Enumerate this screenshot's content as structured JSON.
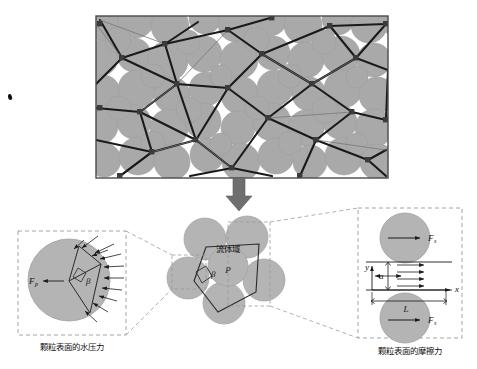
{
  "figure": {
    "domain_type": "scientific-schematic",
    "description_labels": {
      "top_panel": "granular microstructure with pore network",
      "center_panel": "fluid domain between particles",
      "left_panel": "water pressure on particle surface",
      "right_panel": "friction force on particle surface"
    }
  },
  "colors": {
    "particle_gray": "#a9a9a9",
    "particle_edge": "#8f8f8f",
    "pore_white": "#ffffff",
    "network_line": "#1a1a1a",
    "node_square": "#3b3b3b",
    "panel_border": "#4a4a4a",
    "dashed_box": "#9a9a9a",
    "arrow_gray": "#6f6f6f",
    "text": "#111111",
    "background": "#ffffff"
  },
  "top_panel": {
    "name": "granular-microstructure-image",
    "border_color": "#4a4a4a",
    "background_gray": "#a9a9a9"
  },
  "flow_arrow": {
    "name": "downward-transition-arrow",
    "direction": "down",
    "color": "#6f6f6f"
  },
  "center_panel": {
    "fluid_domain_label": "流体域",
    "pressure_symbol": "P",
    "angle_symbol": "β"
  },
  "left_panel": {
    "caption": "颗粒表面的水压力",
    "force_symbol": "F",
    "force_subscript": "p",
    "angle_symbol": "β",
    "arrow_count": 11
  },
  "right_panel": {
    "caption": "颗粒表面的摩擦力",
    "force_symbol_top": "F",
    "force_subscript_top": "s",
    "force_symbol_bottom": "F",
    "force_subscript_bottom": "s",
    "gap_symbol": "a",
    "length_symbol": "L",
    "axis_x": "x",
    "axis_y": "y",
    "flow_arrow_count": 4
  }
}
